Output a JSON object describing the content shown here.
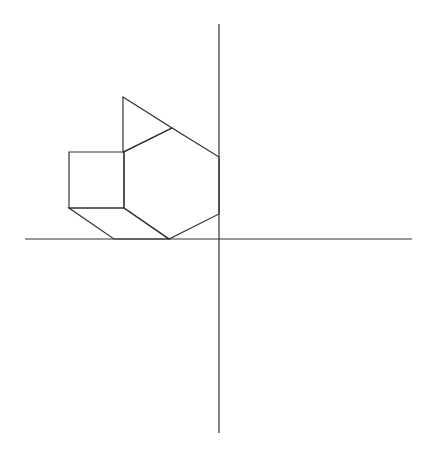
{
  "diagram": {
    "stroke_color": "#333333",
    "background_color": "#ffffff",
    "axes": {
      "horizontal": {
        "x1": 25,
        "y1": 239,
        "x2": 412,
        "y2": 239
      },
      "vertical": {
        "x1": 219,
        "y1": 24,
        "x2": 219,
        "y2": 433
      }
    },
    "shapes": {
      "triangle": {
        "points": "123,97 172,128 123,152"
      },
      "square": {
        "points": "69,152 124,152 124,208 69,208"
      },
      "hexagon": {
        "points": "124,152 172,128 219,157 219,214 169,239 124,208"
      },
      "rhombus": {
        "points": "69,208 124,208 169,239 114,239"
      }
    }
  }
}
